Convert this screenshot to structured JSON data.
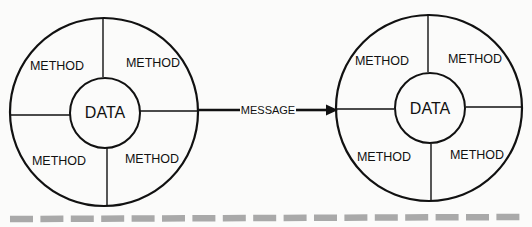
{
  "diagram": {
    "left_object": {
      "center_label": "DATA",
      "methods": [
        "METHOD",
        "METHOD",
        "METHOD",
        "METHOD"
      ]
    },
    "right_object": {
      "center_label": "DATA",
      "methods": [
        "METHOD",
        "METHOD",
        "METHOD",
        "METHOD"
      ]
    },
    "connector": {
      "label": "MESSAGE"
    }
  },
  "colors": {
    "stroke": "#111111",
    "background": "#fbfbfa",
    "dashed_rule": "#a9a9a9"
  }
}
